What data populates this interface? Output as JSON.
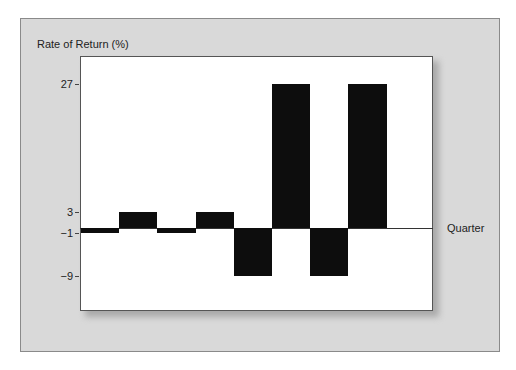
{
  "chart_data": {
    "type": "bar",
    "title": "",
    "xlabel": "Quarter",
    "ylabel": "Rate of Return (%)",
    "categories": [
      "Q1",
      "Q2",
      "Q3",
      "Q4",
      "Q5",
      "Q6",
      "Q7",
      "Q8"
    ],
    "category_labels_visible": false,
    "values": [
      -1,
      3,
      -1,
      3,
      -9,
      27,
      -9,
      27
    ],
    "yticks": [
      27,
      3,
      -1,
      -9
    ],
    "ytick_labels": [
      "27",
      "3",
      "−1",
      "−9"
    ],
    "ylim": [
      -13,
      32
    ],
    "grid": false,
    "legend": null,
    "bar_color": "#0d0d0d",
    "background_color": "#d9d9d9",
    "plot_background": "#ffffff"
  },
  "labels": {
    "ylabel": "Rate of Return (%)",
    "xlabel": "Quarter"
  }
}
